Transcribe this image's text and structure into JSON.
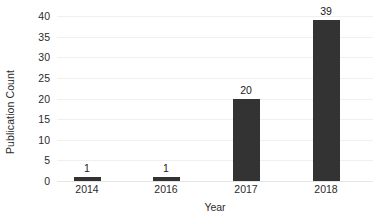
{
  "chart_data": {
    "type": "bar",
    "title": "",
    "subtitle": "",
    "xlabel": "Year",
    "ylabel": "Publication Count",
    "categories": [
      "2014",
      "2016",
      "2017",
      "2018"
    ],
    "values": [
      1,
      1,
      20,
      39
    ],
    "data_labels": [
      "1",
      "1",
      "20",
      "39"
    ],
    "ylim": [
      0,
      40
    ],
    "yticks": [
      0,
      5,
      10,
      15,
      20,
      25,
      30,
      35,
      40
    ],
    "ytick_labels": [
      "0",
      "5",
      "10",
      "15",
      "20",
      "25",
      "30",
      "35",
      "40"
    ],
    "grid": true,
    "legend": null,
    "bar_color": "#333333",
    "grid_color": "#f0f0f0",
    "axis_text_color": "#2b2b2b",
    "background_color": "#ffffff"
  }
}
